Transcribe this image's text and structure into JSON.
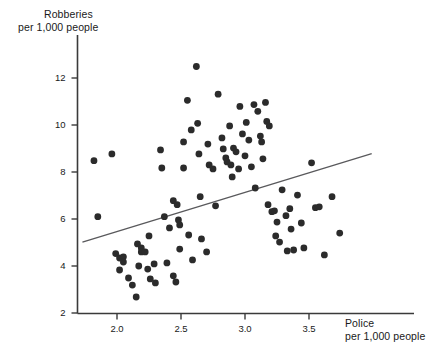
{
  "chart_data": {
    "type": "scatter",
    "title": "",
    "xlabel": "Police per 1,000 people",
    "ylabel": "Robberies per 1,000 people",
    "xlabel_line1": "Police",
    "xlabel_line2": "per 1,000 people",
    "ylabel_line1": "Robberies",
    "ylabel_line2": "per 1,000 people",
    "xlim": [
      1.72,
      3.95
    ],
    "ylim": [
      1.9,
      13.3
    ],
    "xticks": [
      2.0,
      2.5,
      3.0,
      3.5
    ],
    "xtick_labels": [
      "2.0",
      "2.5",
      "3.0",
      "3.5"
    ],
    "yticks": [
      2,
      4,
      6,
      8,
      10,
      12
    ],
    "ytick_labels": [
      "2",
      "4",
      "6",
      "8",
      "10",
      "12"
    ],
    "grid": false,
    "legend": null,
    "marker_color": "#2b2b2b",
    "marker_size_px": 3.4,
    "axis_color": "#3a3a3a",
    "trendline": {
      "label": "fitted regression line",
      "color": "#59595c",
      "x": [
        1.73,
        3.99
      ],
      "y": [
        5.02,
        8.78
      ]
    },
    "points": [
      {
        "x": 1.82,
        "y": 8.48
      },
      {
        "x": 1.96,
        "y": 8.77
      },
      {
        "x": 1.85,
        "y": 6.1
      },
      {
        "x": 1.99,
        "y": 4.53
      },
      {
        "x": 2.02,
        "y": 4.34
      },
      {
        "x": 2.05,
        "y": 4.39
      },
      {
        "x": 2.05,
        "y": 4.17
      },
      {
        "x": 2.02,
        "y": 3.83
      },
      {
        "x": 2.09,
        "y": 3.49
      },
      {
        "x": 2.12,
        "y": 3.19
      },
      {
        "x": 2.15,
        "y": 2.68
      },
      {
        "x": 2.16,
        "y": 4.94
      },
      {
        "x": 2.19,
        "y": 4.77
      },
      {
        "x": 2.19,
        "y": 4.6
      },
      {
        "x": 2.22,
        "y": 4.6
      },
      {
        "x": 2.17,
        "y": 4.0
      },
      {
        "x": 2.24,
        "y": 3.87
      },
      {
        "x": 2.26,
        "y": 3.45
      },
      {
        "x": 2.3,
        "y": 3.28
      },
      {
        "x": 2.25,
        "y": 5.28
      },
      {
        "x": 2.29,
        "y": 4.09
      },
      {
        "x": 2.34,
        "y": 8.94
      },
      {
        "x": 2.35,
        "y": 8.17
      },
      {
        "x": 2.37,
        "y": 6.1
      },
      {
        "x": 2.41,
        "y": 5.62
      },
      {
        "x": 2.39,
        "y": 4.13
      },
      {
        "x": 2.44,
        "y": 3.58
      },
      {
        "x": 2.46,
        "y": 3.32
      },
      {
        "x": 2.44,
        "y": 6.78
      },
      {
        "x": 2.47,
        "y": 6.61
      },
      {
        "x": 2.48,
        "y": 5.96
      },
      {
        "x": 2.49,
        "y": 5.75
      },
      {
        "x": 2.49,
        "y": 4.72
      },
      {
        "x": 2.52,
        "y": 9.28
      },
      {
        "x": 2.52,
        "y": 8.17
      },
      {
        "x": 2.55,
        "y": 11.05
      },
      {
        "x": 2.58,
        "y": 9.79
      },
      {
        "x": 2.56,
        "y": 5.32
      },
      {
        "x": 2.59,
        "y": 4.26
      },
      {
        "x": 2.62,
        "y": 12.49
      },
      {
        "x": 2.63,
        "y": 10.07
      },
      {
        "x": 2.64,
        "y": 8.77
      },
      {
        "x": 2.65,
        "y": 6.95
      },
      {
        "x": 2.66,
        "y": 5.15
      },
      {
        "x": 2.7,
        "y": 4.6
      },
      {
        "x": 2.71,
        "y": 9.19
      },
      {
        "x": 2.72,
        "y": 8.3
      },
      {
        "x": 2.75,
        "y": 8.13
      },
      {
        "x": 2.77,
        "y": 6.56
      },
      {
        "x": 2.79,
        "y": 11.31
      },
      {
        "x": 2.82,
        "y": 9.45
      },
      {
        "x": 2.83,
        "y": 8.98
      },
      {
        "x": 2.85,
        "y": 8.6
      },
      {
        "x": 2.86,
        "y": 8.43
      },
      {
        "x": 2.88,
        "y": 9.96
      },
      {
        "x": 2.89,
        "y": 8.3
      },
      {
        "x": 2.9,
        "y": 7.79
      },
      {
        "x": 2.91,
        "y": 9.02
      },
      {
        "x": 2.93,
        "y": 8.86
      },
      {
        "x": 2.95,
        "y": 8.13
      },
      {
        "x": 2.96,
        "y": 10.79
      },
      {
        "x": 2.98,
        "y": 9.62
      },
      {
        "x": 3.0,
        "y": 8.69
      },
      {
        "x": 3.01,
        "y": 10.11
      },
      {
        "x": 3.03,
        "y": 9.36
      },
      {
        "x": 3.05,
        "y": 8.22
      },
      {
        "x": 3.07,
        "y": 10.87
      },
      {
        "x": 3.08,
        "y": 7.32
      },
      {
        "x": 3.1,
        "y": 10.58
      },
      {
        "x": 3.12,
        "y": 9.53
      },
      {
        "x": 3.13,
        "y": 9.28
      },
      {
        "x": 3.14,
        "y": 8.56
      },
      {
        "x": 3.16,
        "y": 10.96
      },
      {
        "x": 3.17,
        "y": 10.15
      },
      {
        "x": 3.19,
        "y": 9.96
      },
      {
        "x": 3.18,
        "y": 6.61
      },
      {
        "x": 3.21,
        "y": 6.31
      },
      {
        "x": 3.23,
        "y": 6.35
      },
      {
        "x": 3.25,
        "y": 5.87
      },
      {
        "x": 3.24,
        "y": 5.28
      },
      {
        "x": 3.27,
        "y": 5.02
      },
      {
        "x": 3.29,
        "y": 7.24
      },
      {
        "x": 3.32,
        "y": 6.14
      },
      {
        "x": 3.35,
        "y": 6.44
      },
      {
        "x": 3.36,
        "y": 5.57
      },
      {
        "x": 3.33,
        "y": 4.64
      },
      {
        "x": 3.38,
        "y": 4.68
      },
      {
        "x": 3.41,
        "y": 7.02
      },
      {
        "x": 3.44,
        "y": 5.83
      },
      {
        "x": 3.46,
        "y": 4.77
      },
      {
        "x": 3.52,
        "y": 8.39
      },
      {
        "x": 3.55,
        "y": 6.48
      },
      {
        "x": 3.58,
        "y": 6.52
      },
      {
        "x": 3.62,
        "y": 4.47
      },
      {
        "x": 3.68,
        "y": 6.95
      },
      {
        "x": 3.74,
        "y": 5.4
      }
    ]
  }
}
